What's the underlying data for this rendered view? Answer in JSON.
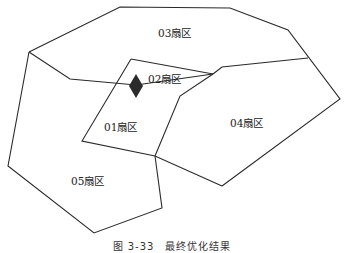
{
  "sectors": [
    {
      "id": "01",
      "label": "01扇区",
      "x": 104,
      "y": 118
    },
    {
      "id": "02",
      "label": "02扇区",
      "x": 148,
      "y": 70
    },
    {
      "id": "03",
      "label": "03扇区",
      "x": 158,
      "y": 33
    },
    {
      "id": "04",
      "label": "04扇区",
      "x": 230,
      "y": 118
    },
    {
      "id": "05",
      "label": "05扇区",
      "x": 71,
      "y": 176
    }
  ],
  "marker": {
    "type": "diamond",
    "x": 136,
    "y": 87,
    "color": "#2b2b2b"
  },
  "caption": "图 3-33　最终优化结果",
  "colors": {
    "line": "#2a2a2a",
    "background": "#ffffff"
  }
}
